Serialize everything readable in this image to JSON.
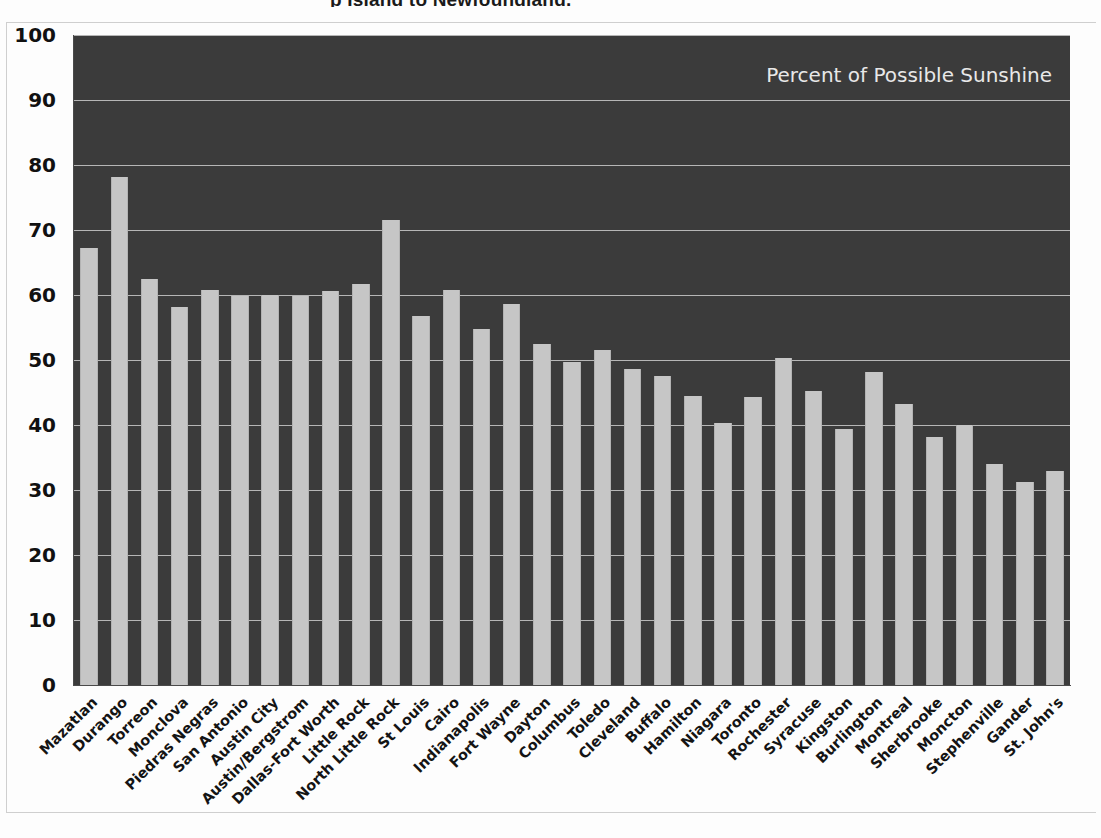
{
  "page": {
    "cropped_title_fragment": "p                              Island to Newfoundland."
  },
  "chart_data": {
    "type": "bar",
    "title": "Percent of Possible Sunshine",
    "annotation": "Percent of Possible Sunshine",
    "xlabel": "",
    "ylabel": "",
    "ylim": [
      0,
      100
    ],
    "ytick_step": 10,
    "yticks": [
      100,
      90,
      80,
      70,
      60,
      50,
      40,
      30,
      20,
      10,
      0
    ],
    "grid": true,
    "legend_position": "none",
    "plot_background": "#3b3b3b",
    "bar_color": "#c6c6c6",
    "gridline_color": "#cdcdcd",
    "annotation_color": "#e8e8e8",
    "categories": [
      "Mazatlan",
      "Durango",
      "Torreon",
      "Monclova",
      "Piedras Negras",
      "San Antonio",
      "Austin City",
      "Austin/Bergstrom",
      "Dallas-Fort Worth",
      "Little Rock",
      "North Little Rock",
      "St Louis",
      "Cairo",
      "Indianapolis",
      "Fort Wayne",
      "Dayton",
      "Columbus",
      "Toledo",
      "Cleveland",
      "Buffalo",
      "Hamilton",
      "Niagara",
      "Toronto",
      "Rochester",
      "Syracuse",
      "Kingston",
      "Burlington",
      "Montreal",
      "Sherbrooke",
      "Moncton",
      "Stephenville",
      "Gander",
      "St. John's"
    ],
    "values": [
      67.2,
      78.2,
      62.4,
      58.1,
      60.8,
      59.9,
      60.0,
      59.9,
      60.6,
      61.7,
      71.6,
      56.7,
      60.7,
      54.7,
      58.6,
      52.5,
      49.7,
      51.5,
      48.6,
      47.6,
      44.4,
      40.3,
      44.3,
      50.3,
      45.3,
      39.4,
      48.1,
      43.2,
      38.2,
      40.0,
      34.0,
      31.2,
      33.0
    ]
  }
}
